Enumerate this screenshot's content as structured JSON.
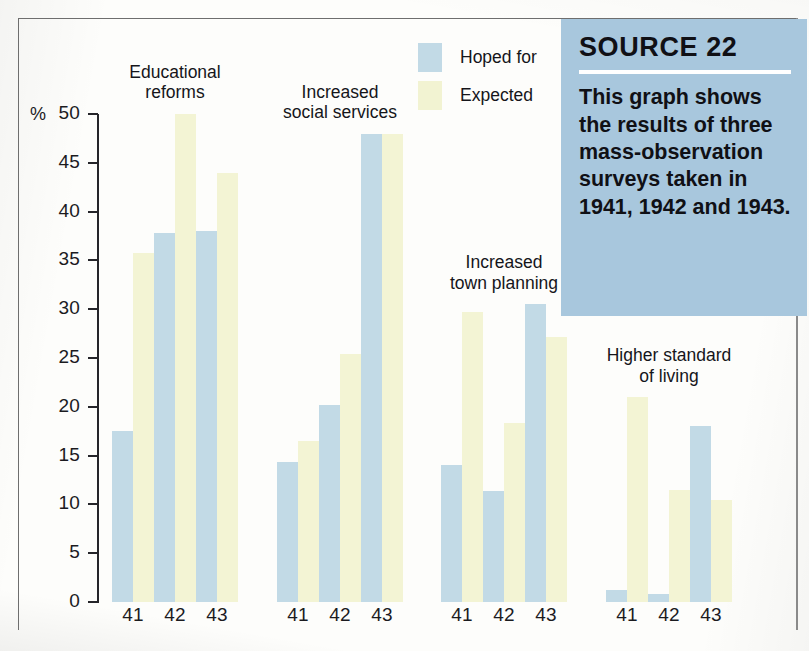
{
  "figure": {
    "y_axis_unit": "%",
    "y_ticks": [
      0,
      5,
      10,
      15,
      20,
      25,
      30,
      35,
      40,
      45,
      50
    ]
  },
  "legend": {
    "items": [
      {
        "label": "Hoped for",
        "color": "#c2dae6",
        "key": "hoped"
      },
      {
        "label": "Expected",
        "color": "#f2f3d2",
        "key": "expected"
      }
    ]
  },
  "source": {
    "title": "SOURCE 22",
    "body": "This graph shows the results of three mass-observation surveys taken in 1941, 1942 and 1943.",
    "panel_color": "#a8c7dd"
  },
  "chart_data": {
    "type": "bar",
    "title": "",
    "xlabel": "",
    "ylabel": "%",
    "ylim": [
      0,
      50
    ],
    "yticks": [
      0,
      5,
      10,
      15,
      20,
      25,
      30,
      35,
      40,
      45,
      50
    ],
    "grid": false,
    "legend_position": "top-center",
    "series": [
      {
        "name": "Hoped for",
        "color": "#c2dae6"
      },
      {
        "name": "Expected",
        "color": "#f2f3d2"
      }
    ],
    "groups": [
      {
        "label": "Educational reforms",
        "categories": [
          "41",
          "42",
          "43"
        ],
        "hoped_for": [
          17.5,
          37.8,
          38.0
        ],
        "expected": [
          35.8,
          50.0,
          44.0
        ]
      },
      {
        "label": "Increased social services",
        "categories": [
          "41",
          "42",
          "43"
        ],
        "hoped_for": [
          14.3,
          20.2,
          48.0
        ],
        "expected": [
          16.5,
          25.4,
          48.0
        ]
      },
      {
        "label": "Increased town planning",
        "categories": [
          "41",
          "42",
          "43"
        ],
        "hoped_for": [
          14.0,
          11.4,
          30.5
        ],
        "expected": [
          29.7,
          18.3,
          27.2
        ]
      },
      {
        "label": "Higher standard of living",
        "categories": [
          "41",
          "42",
          "43"
        ],
        "hoped_for": [
          1.2,
          0.8,
          18.0
        ],
        "expected": [
          21.0,
          11.5,
          10.5
        ]
      }
    ]
  },
  "group_title_lines": [
    "Educational\nreforms",
    "Increased\nsocial services",
    "Increased\ntown planning",
    "Higher standard\nof living"
  ]
}
